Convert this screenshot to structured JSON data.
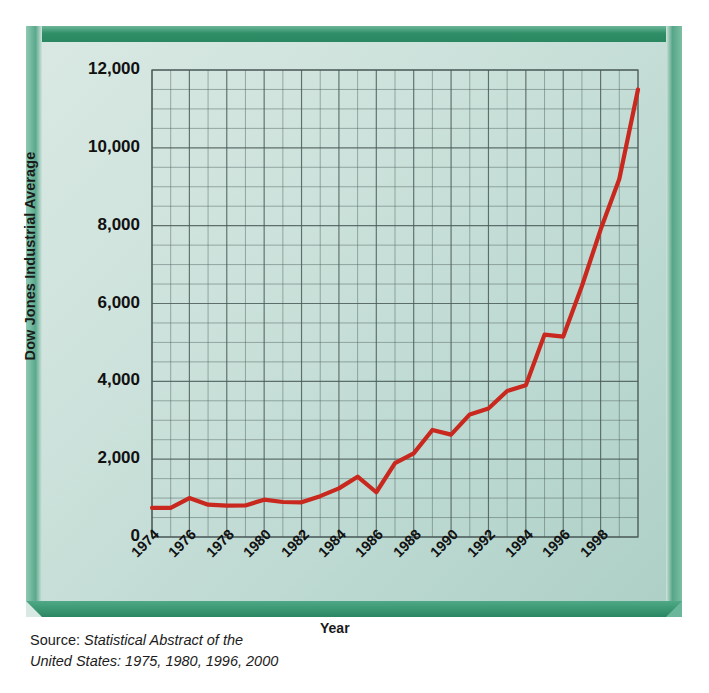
{
  "figure": {
    "clipped_title": "",
    "source_prefix": "Source: ",
    "source_italic_line1": "Statistical Abstract of the",
    "source_italic_line2": "United States: 1975, 1980, 1996, 2000",
    "frame_color": "#2f8f67",
    "panel_background": "#cfe3dd",
    "line_color": "#c8281e",
    "grid_color": "#4a5a58"
  },
  "chart_data": {
    "type": "line",
    "title": "",
    "xlabel": "Year",
    "ylabel": "Dow Jones Industrial Average",
    "xlim": [
      1974,
      2000
    ],
    "ylim": [
      0,
      12000
    ],
    "ytick_labels": [
      "0",
      "2,000",
      "4,000",
      "6,000",
      "8,000",
      "10,000",
      "12,000"
    ],
    "ytick_values": [
      0,
      2000,
      4000,
      6000,
      8000,
      10000,
      12000
    ],
    "yminor_step": 500,
    "xtick_labels": [
      "1974",
      "1976",
      "1978",
      "1980",
      "1982",
      "1984",
      "1986",
      "1988",
      "1990",
      "1992",
      "1994",
      "1996",
      "1998"
    ],
    "xtick_values": [
      1974,
      1976,
      1978,
      1980,
      1982,
      1984,
      1986,
      1988,
      1990,
      1992,
      1994,
      1996,
      1998
    ],
    "xminor_step": 1,
    "grid": true,
    "legend": false,
    "series": [
      {
        "name": "Dow Jones Industrial Average",
        "color": "#c8281e",
        "x": [
          1974,
          1975,
          1976,
          1977,
          1978,
          1979,
          1980,
          1981,
          1982,
          1983,
          1984,
          1985,
          1986,
          1987,
          1988,
          1989,
          1990,
          1991,
          1992,
          1993,
          1994,
          1995,
          1996,
          1997,
          1998,
          1999,
          2000
        ],
        "values": [
          750,
          750,
          1000,
          830,
          805,
          810,
          960,
          900,
          890,
          1050,
          1250,
          1550,
          1150,
          1900,
          2150,
          2750,
          2630,
          3150,
          3300,
          3750,
          3900,
          5200,
          5150,
          6450,
          7900,
          9200,
          11500
        ]
      }
    ]
  }
}
